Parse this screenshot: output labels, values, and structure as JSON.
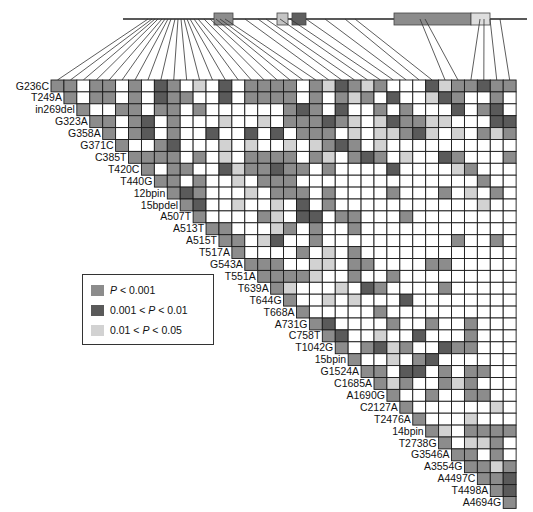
{
  "figure": {
    "type": "linkage-disequilibrium-triangle-plot",
    "colors": {
      "p_lt_0_001": "#8c8c8c",
      "p_0_001_to_0_01": "#5a5a5a",
      "p_0_01_to_0_05": "#d2d2d2",
      "ns": "#ffffff",
      "border": "#1a1a1a"
    }
  },
  "legend": {
    "items": [
      {
        "key": 1,
        "label_prefix": "",
        "italic": "P",
        "label_suffix": " < 0.001",
        "color": "#8c8c8c"
      },
      {
        "key": 2,
        "label_prefix": "0.001 < ",
        "italic": "P",
        "label_suffix": " < 0.01",
        "color": "#5a5a5a"
      },
      {
        "key": 3,
        "label_prefix": "0.01 < ",
        "italic": "P",
        "label_suffix": " < 0.05",
        "color": "#d2d2d2"
      }
    ]
  },
  "gene_structure": {
    "line": {
      "x1": 123,
      "x2": 527,
      "y": 19
    },
    "exons": [
      {
        "x": 214,
        "w": 19,
        "color": "#8c8c8c"
      },
      {
        "x": 277,
        "w": 11,
        "color": "#c4c4c4"
      },
      {
        "x": 292,
        "w": 14,
        "color": "#5f5f5f"
      },
      {
        "x": 394,
        "w": 77,
        "color": "#8c8c8c"
      },
      {
        "x": 471,
        "w": 19,
        "color": "#dedede"
      }
    ]
  },
  "markers": [
    "G236C",
    "T249A",
    "in269del",
    "G323A",
    "G358A",
    "G371C",
    "C385T",
    "T420C",
    "T440G",
    "12bpin",
    "15bpdel",
    "A507T",
    "A513T",
    "A515T",
    "T517A",
    "G543A",
    "T551A",
    "T639A",
    "T644G",
    "T668A",
    "A731G",
    "C758T",
    "T1042G",
    "15bpin",
    "G1524A",
    "C1685A",
    "A1690G",
    "C2127A",
    "T2476A",
    "14bpin",
    "T2738G",
    "G3546A",
    "A3554G",
    "A4497C",
    "T4498A",
    "A4694G"
  ],
  "marker_gene_x": [
    148,
    152,
    155,
    158,
    162,
    165,
    168,
    171,
    175,
    178,
    181,
    184,
    187,
    190,
    194,
    198,
    204,
    210,
    216,
    220,
    225,
    245,
    258,
    266,
    280,
    290,
    306,
    325,
    345,
    355,
    420,
    425,
    480,
    484,
    490,
    500
  ],
  "chart_data": {
    "type": "heatmap",
    "title": "",
    "xlabel": "",
    "ylabel": "",
    "legend_position": "left-middle",
    "categories": [
      "G236C",
      "T249A",
      "in269del",
      "G323A",
      "G358A",
      "G371C",
      "C385T",
      "T420C",
      "T440G",
      "12bpin",
      "15bpdel",
      "A507T",
      "A513T",
      "A515T",
      "T517A",
      "G543A",
      "T551A",
      "T639A",
      "T644G",
      "T668A",
      "A731G",
      "C758T",
      "T1042G",
      "15bpin",
      "G1524A",
      "C1685A",
      "A1690G",
      "C2127A",
      "T2476A",
      "14bpin",
      "T2738G",
      "G3546A",
      "A3554G",
      "A4497C",
      "T4498A",
      "A4694G"
    ],
    "matrix": [
      [
        1,
        1,
        0,
        1,
        1,
        0,
        1,
        0,
        2,
        1,
        0,
        3,
        0,
        2,
        0,
        1,
        1,
        1,
        1,
        0,
        1,
        3,
        2,
        1,
        3,
        1,
        0,
        0,
        0,
        2,
        3,
        1,
        1,
        2,
        1,
        1
      ],
      [
        1,
        0,
        1,
        1,
        0,
        1,
        0,
        2,
        1,
        1,
        0,
        0,
        2,
        0,
        1,
        1,
        1,
        1,
        0,
        1,
        0,
        1,
        3,
        1,
        0,
        2,
        0,
        0,
        3,
        2,
        1,
        0,
        0,
        1,
        0,
        1
      ],
      [
        1,
        0,
        0,
        1,
        1,
        0,
        1,
        1,
        0,
        1,
        0,
        0,
        0,
        0,
        0,
        0,
        1,
        2,
        1,
        0,
        2,
        0,
        0,
        1,
        0,
        1,
        0,
        0,
        0,
        2,
        0,
        1,
        2,
        0,
        0,
        1
      ],
      [
        1,
        1,
        0,
        1,
        2,
        0,
        1,
        0,
        0,
        0,
        3,
        0,
        0,
        3,
        0,
        1,
        1,
        1,
        2,
        1,
        3,
        0,
        3,
        2,
        1,
        1,
        3,
        3,
        0,
        0,
        0,
        2,
        2,
        3,
        3,
        1
      ],
      [
        1,
        0,
        1,
        2,
        0,
        1,
        0,
        0,
        2,
        0,
        0,
        2,
        0,
        2,
        0,
        1,
        1,
        1,
        0,
        3,
        0,
        3,
        3,
        1,
        2,
        3,
        0,
        3,
        0,
        1,
        3,
        1,
        3,
        3,
        0,
        1
      ],
      [
        1,
        0,
        0,
        1,
        2,
        0,
        0,
        0,
        3,
        0,
        3,
        0,
        0,
        3,
        0,
        3,
        1,
        2,
        1,
        0,
        3,
        0,
        0,
        0,
        0,
        0,
        0,
        0,
        0,
        0,
        0,
        0,
        0,
        0,
        0,
        0
      ],
      [
        1,
        1,
        1,
        1,
        0,
        1,
        0,
        3,
        0,
        1,
        1,
        1,
        1,
        0,
        1,
        3,
        0,
        1,
        2,
        1,
        0,
        3,
        0,
        0,
        2,
        1,
        0,
        0,
        0,
        1,
        1,
        0,
        0,
        0,
        1,
        1
      ],
      [
        1,
        0,
        1,
        1,
        0,
        0,
        2,
        3,
        1,
        1,
        2,
        1,
        1,
        0,
        1,
        0,
        0,
        0,
        0,
        2,
        0,
        0,
        0,
        0,
        3,
        1,
        0,
        0,
        0,
        1,
        1,
        0,
        1,
        1,
        0,
        3
      ],
      [
        1,
        1,
        0,
        1,
        0,
        0,
        3,
        0,
        1,
        1,
        1,
        0,
        0,
        0,
        0,
        0,
        0,
        0,
        0,
        0,
        0,
        0,
        0,
        0,
        0,
        1,
        0,
        0,
        0,
        0,
        1,
        0,
        0,
        0,
        0,
        1
      ],
      [
        1,
        2,
        1,
        0,
        0,
        0,
        3,
        0,
        1,
        1,
        1,
        0,
        1,
        0,
        0,
        0,
        0,
        1,
        0,
        0,
        0,
        1,
        0,
        3,
        0,
        1,
        0,
        0,
        0,
        1,
        1,
        0,
        1,
        1,
        1,
        2
      ],
      [
        1,
        2,
        0,
        0,
        3,
        0,
        0,
        3,
        0,
        2,
        0,
        1,
        0,
        0,
        0,
        0,
        0,
        0,
        0,
        0,
        0,
        0,
        0,
        3,
        0,
        0,
        0,
        0,
        0,
        0,
        0,
        0,
        0,
        0,
        0,
        0
      ],
      [
        1,
        0,
        0,
        0,
        0,
        1,
        3,
        0,
        2,
        2,
        0,
        1,
        1,
        0,
        0,
        0,
        1,
        0,
        0,
        0,
        0,
        0,
        0,
        0,
        0,
        0,
        0,
        0,
        0,
        2,
        0,
        0,
        0,
        0,
        0,
        0
      ],
      [
        1,
        1,
        0,
        0,
        0,
        3,
        1,
        0,
        1,
        0,
        0,
        1,
        0,
        0,
        0,
        0,
        0,
        0,
        0,
        0,
        0,
        0,
        0,
        0,
        0,
        0,
        0,
        0,
        0,
        0,
        0,
        0,
        0,
        0,
        0,
        0
      ],
      [
        1,
        1,
        0,
        3,
        2,
        0,
        0,
        1,
        0,
        0,
        0,
        0,
        0,
        0,
        0,
        0,
        0,
        0,
        1,
        0,
        0,
        1,
        0,
        0,
        0,
        0,
        0,
        0,
        0,
        0,
        0,
        0,
        0,
        0,
        0,
        0
      ],
      [
        1,
        0,
        0,
        0,
        0,
        1,
        0,
        3,
        0,
        1,
        0,
        0,
        0,
        0,
        0,
        0,
        0,
        0,
        0,
        0,
        0,
        0,
        0,
        0,
        0,
        0,
        0,
        0,
        0,
        0,
        0,
        0,
        0,
        0,
        0,
        0
      ],
      [
        1,
        1,
        1,
        0,
        0,
        3,
        3,
        0,
        1,
        1,
        0,
        0,
        0,
        0,
        1,
        1,
        0,
        0,
        0,
        0,
        0,
        0,
        0,
        0,
        0,
        0,
        0,
        0,
        0,
        0,
        0,
        0,
        0,
        0,
        0,
        0
      ],
      [
        1,
        1,
        1,
        1,
        3,
        0,
        0,
        1,
        0,
        0,
        1,
        0,
        0,
        0,
        0,
        0,
        0,
        0,
        0,
        0,
        0,
        0,
        0,
        0,
        0,
        0,
        0,
        0,
        0,
        0,
        0,
        0,
        0,
        0,
        0,
        0
      ],
      [
        1,
        3,
        0,
        0,
        0,
        3,
        0,
        2,
        1,
        0,
        0,
        0,
        0,
        1,
        0,
        0,
        0,
        0,
        0,
        0,
        0,
        0,
        0,
        0,
        0,
        0,
        0,
        0,
        0,
        0,
        0,
        0,
        0,
        0,
        0,
        0
      ],
      [
        1,
        0,
        0,
        3,
        0,
        3,
        0,
        0,
        0,
        2,
        0,
        0,
        0,
        0,
        0,
        0,
        0,
        0,
        0,
        0,
        0,
        0,
        0,
        0,
        0,
        0,
        0,
        0,
        0,
        0,
        0,
        0,
        0,
        0,
        0,
        0
      ],
      [
        1,
        0,
        0,
        0,
        0,
        0,
        1,
        0,
        0,
        0,
        0,
        0,
        0,
        0,
        0,
        0,
        0,
        0,
        0,
        0,
        0,
        0,
        0,
        0,
        0,
        0,
        0,
        0,
        0,
        0,
        0,
        0,
        0,
        0,
        0,
        0
      ],
      [
        1,
        2,
        0,
        0,
        0,
        0,
        1,
        0,
        0,
        1,
        0,
        0,
        1,
        0,
        0,
        0,
        0,
        0,
        0,
        0,
        0,
        0,
        0,
        0,
        0,
        0,
        0,
        0,
        0,
        0,
        0,
        0,
        0,
        0,
        0,
        0
      ],
      [
        1,
        2,
        0,
        0,
        3,
        0,
        0,
        2,
        0,
        0,
        0,
        1,
        0,
        0,
        0,
        0,
        0,
        0,
        0,
        0,
        0,
        0,
        0,
        0,
        0,
        0,
        0,
        0,
        0,
        0,
        0,
        0,
        0,
        0,
        0,
        0
      ],
      [
        1,
        0,
        1,
        2,
        3,
        1,
        0,
        0,
        2,
        1,
        1,
        0,
        0,
        0,
        0,
        0,
        0,
        0,
        0,
        0,
        0,
        0,
        0,
        0,
        0,
        0,
        0,
        0,
        0,
        0,
        0,
        0,
        0,
        0,
        0,
        0
      ],
      [
        1,
        0,
        0,
        3,
        0,
        1,
        2,
        0,
        0,
        0,
        0,
        0,
        0,
        0,
        0,
        0,
        0,
        0,
        0,
        0,
        0,
        0,
        0,
        0,
        0,
        0,
        0,
        0,
        0,
        0,
        0,
        0,
        0,
        0,
        0,
        0
      ],
      [
        1,
        1,
        0,
        2,
        2,
        0,
        1,
        0,
        1,
        1,
        0,
        0,
        0,
        0,
        0,
        0,
        0,
        0,
        0,
        0,
        0,
        0,
        0,
        0,
        0,
        0,
        0,
        0,
        0,
        0,
        0,
        0,
        0,
        0,
        0,
        0
      ],
      [
        1,
        3,
        1,
        0,
        0,
        1,
        3,
        1,
        0,
        0,
        0,
        0,
        0,
        0,
        0,
        0,
        0,
        0,
        0,
        0,
        0,
        0,
        0,
        0,
        0,
        0,
        0,
        0,
        0,
        0,
        0,
        0,
        0,
        0,
        0,
        0
      ],
      [
        1,
        0,
        0,
        1,
        0,
        0,
        1,
        1,
        0,
        0,
        0,
        0,
        0,
        0,
        0,
        0,
        0,
        0,
        0,
        0,
        0,
        0,
        0,
        0,
        0,
        0,
        0,
        0,
        0,
        0,
        0,
        0,
        0,
        0,
        0,
        0
      ],
      [
        1,
        0,
        0,
        0,
        0,
        0,
        0,
        3,
        0,
        0,
        0,
        0,
        0,
        0,
        0,
        0,
        0,
        0,
        0,
        0,
        0,
        0,
        0,
        0,
        0,
        0,
        0,
        0,
        0,
        0,
        0,
        0,
        0,
        0,
        0,
        0
      ],
      [
        1,
        0,
        0,
        0,
        3,
        0,
        0,
        0,
        0,
        0,
        0,
        0,
        0,
        0,
        0,
        0,
        0,
        0,
        0,
        0,
        0,
        0,
        0,
        0,
        0,
        0,
        0,
        0,
        0,
        0,
        0,
        0,
        0,
        0,
        0,
        0
      ],
      [
        1,
        3,
        0,
        1,
        1,
        1,
        1,
        0,
        0,
        0,
        0,
        0,
        0,
        0,
        0,
        0,
        0,
        0,
        0,
        0,
        0,
        0,
        0,
        0,
        0,
        0,
        0,
        0,
        0,
        0,
        0,
        0,
        0,
        0,
        0,
        0
      ],
      [
        1,
        0,
        3,
        3,
        1,
        0,
        0,
        0,
        0,
        0,
        0,
        0,
        0,
        0,
        0,
        0,
        0,
        0,
        0,
        0,
        0,
        0,
        0,
        0,
        0,
        0,
        0,
        0,
        0,
        0,
        0,
        0,
        0,
        0,
        0,
        0
      ],
      [
        1,
        1,
        0,
        1,
        0,
        0,
        0,
        0,
        0,
        0,
        0,
        0,
        0,
        0,
        0,
        0,
        0,
        0,
        0,
        0,
        0,
        0,
        0,
        0,
        0,
        0,
        0,
        0,
        0,
        0,
        0,
        0,
        0,
        0,
        0,
        0
      ],
      [
        1,
        1,
        3,
        1,
        0,
        0,
        0,
        0,
        0,
        0,
        0,
        0,
        0,
        0,
        0,
        0,
        0,
        0,
        0,
        0,
        0,
        0,
        0,
        0,
        0,
        0,
        0,
        0,
        0,
        0,
        0,
        0,
        0,
        0,
        0,
        0
      ],
      [
        1,
        1,
        2,
        0,
        0,
        0,
        0,
        0,
        0,
        0,
        0,
        0,
        0,
        0,
        0,
        0,
        0,
        0,
        0,
        0,
        0,
        0,
        0,
        0,
        0,
        0,
        0,
        0,
        0,
        0,
        0,
        0,
        0,
        0,
        0,
        0
      ],
      [
        1,
        2,
        0,
        0,
        0,
        0,
        0,
        0,
        0,
        0,
        0,
        0,
        0,
        0,
        0,
        0,
        0,
        0,
        0,
        0,
        0,
        0,
        0,
        0,
        0,
        0,
        0,
        0,
        0,
        0,
        0,
        0,
        0,
        0,
        0,
        0
      ],
      [
        1,
        0,
        0,
        0,
        0,
        0,
        0,
        0,
        0,
        0,
        0,
        0,
        0,
        0,
        0,
        0,
        0,
        0,
        0,
        0,
        0,
        0,
        0,
        0,
        0,
        0,
        0,
        0,
        0,
        0,
        0,
        0,
        0,
        0,
        0,
        0
      ]
    ]
  }
}
